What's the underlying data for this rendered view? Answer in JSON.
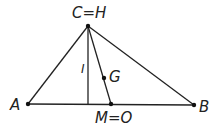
{
  "diagram": {
    "type": "triangle-geometry",
    "stroke_color": "#222222",
    "background": "#ffffff",
    "points": {
      "C": {
        "label": "C=H",
        "x": 88,
        "y": 26
      },
      "A": {
        "label": "A",
        "x": 28,
        "y": 104
      },
      "B": {
        "label": "B",
        "x": 194,
        "y": 105
      },
      "M": {
        "label": "M=O",
        "x": 111,
        "y": 104
      },
      "G": {
        "label": "G",
        "x": 104,
        "y": 78
      },
      "foot": {
        "x": 88,
        "y": 104
      }
    },
    "altitude_label": "I",
    "segments": [
      "CA",
      "CB",
      "AB",
      "C-foot (altitude)",
      "CM (median)"
    ]
  }
}
